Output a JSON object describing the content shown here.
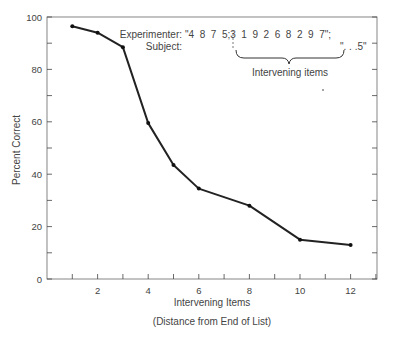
{
  "chart_data": {
    "type": "line",
    "title": "",
    "xlabel": "Intervening Items",
    "xlabel_sub": "(Distance  from End of List)",
    "ylabel": "Percent Correct",
    "x": [
      1,
      2,
      3,
      4,
      5,
      6,
      8,
      10,
      12
    ],
    "values": [
      96.5,
      94,
      88.5,
      59.5,
      43.5,
      34.5,
      28,
      15,
      13
    ],
    "series": [
      {
        "name": "Percent Correct",
        "x": [
          1,
          2,
          3,
          4,
          5,
          6,
          8,
          10,
          12
        ],
        "values": [
          96.5,
          94,
          88.5,
          59.5,
          43.5,
          34.5,
          28,
          15,
          13
        ]
      }
    ],
    "xlim": [
      0,
      13
    ],
    "ylim": [
      0,
      100
    ],
    "x_ticks": [
      "2",
      "4",
      "6",
      "8",
      "10",
      "12"
    ],
    "y_ticks": [
      "0",
      "20",
      "40",
      "60",
      "80",
      "100"
    ],
    "grid": false,
    "legend": null,
    "annotations": {
      "experimenter_label": "Experimenter:",
      "experimenter_sequence": "\"4  8  7  5;3  1  9  2  6  8  2  9  7\";",
      "subject_label": "Subject:",
      "subject_response": "\". . .5\"",
      "brace_label": "Intervening items"
    }
  }
}
